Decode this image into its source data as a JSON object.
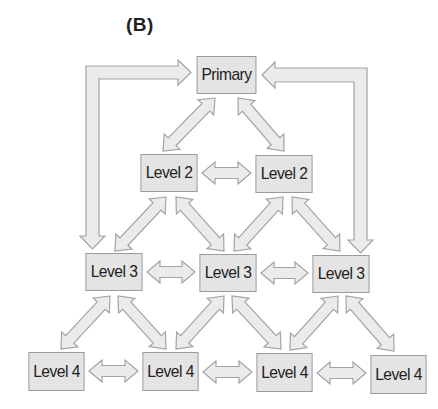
{
  "panel_label": "(B)",
  "colors": {
    "node_fill": "#e4e4e4",
    "node_border": "#9a9a9a",
    "arrow_fill": "#ebebeb",
    "arrow_stroke": "#a3a3a3",
    "text": "#222222"
  },
  "nodes": [
    {
      "id": "primary",
      "label": "Primary",
      "level": 1,
      "x": 194,
      "y": 56,
      "w": 65,
      "h": 38
    },
    {
      "id": "l2a",
      "label": "Level 2",
      "level": 2,
      "x": 138,
      "y": 154,
      "w": 62,
      "h": 38
    },
    {
      "id": "l2b",
      "label": "Level 2",
      "level": 2,
      "x": 253,
      "y": 155,
      "w": 62,
      "h": 38
    },
    {
      "id": "l3a",
      "label": "Level 3",
      "level": 3,
      "x": 83,
      "y": 253,
      "w": 62,
      "h": 38
    },
    {
      "id": "l3b",
      "label": "Level 3",
      "level": 3,
      "x": 197,
      "y": 254,
      "w": 62,
      "h": 38
    },
    {
      "id": "l3c",
      "label": "Level 3",
      "level": 3,
      "x": 310,
      "y": 255,
      "w": 62,
      "h": 38
    },
    {
      "id": "l4a",
      "label": "Level 4",
      "level": 4,
      "x": 26,
      "y": 352,
      "w": 61,
      "h": 39
    },
    {
      "id": "l4b",
      "label": "Level 4",
      "level": 4,
      "x": 140,
      "y": 352,
      "w": 61,
      "h": 39
    },
    {
      "id": "l4c",
      "label": "Level 4",
      "level": 4,
      "x": 254,
      "y": 353,
      "w": 61,
      "h": 39
    },
    {
      "id": "l4d",
      "label": "Level 4",
      "level": 4,
      "x": 368,
      "y": 355,
      "w": 61,
      "h": 39
    }
  ],
  "edges": [
    {
      "from": "l3a",
      "to": "primary",
      "type": "elbow-one-way",
      "direction": "primary-to-l3a"
    },
    {
      "from": "l3c",
      "to": "primary",
      "type": "elbow-one-way",
      "direction": "primary-to-l3c"
    },
    {
      "from": "primary",
      "to": "l2a",
      "type": "bidirectional"
    },
    {
      "from": "primary",
      "to": "l2b",
      "type": "bidirectional"
    },
    {
      "from": "l2a",
      "to": "l2b",
      "type": "bidirectional"
    },
    {
      "from": "l2a",
      "to": "l3a",
      "type": "bidirectional"
    },
    {
      "from": "l2a",
      "to": "l3b",
      "type": "bidirectional"
    },
    {
      "from": "l2b",
      "to": "l3b",
      "type": "bidirectional"
    },
    {
      "from": "l2b",
      "to": "l3c",
      "type": "bidirectional"
    },
    {
      "from": "l3a",
      "to": "l3b",
      "type": "bidirectional"
    },
    {
      "from": "l3b",
      "to": "l3c",
      "type": "bidirectional"
    },
    {
      "from": "l3a",
      "to": "l4a",
      "type": "bidirectional"
    },
    {
      "from": "l3a",
      "to": "l4b",
      "type": "bidirectional"
    },
    {
      "from": "l3b",
      "to": "l4b",
      "type": "bidirectional"
    },
    {
      "from": "l3b",
      "to": "l4c",
      "type": "bidirectional"
    },
    {
      "from": "l3c",
      "to": "l4c",
      "type": "bidirectional"
    },
    {
      "from": "l3c",
      "to": "l4d",
      "type": "bidirectional"
    },
    {
      "from": "l4a",
      "to": "l4b",
      "type": "bidirectional"
    },
    {
      "from": "l4b",
      "to": "l4c",
      "type": "bidirectional"
    },
    {
      "from": "l4c",
      "to": "l4d",
      "type": "bidirectional"
    }
  ]
}
